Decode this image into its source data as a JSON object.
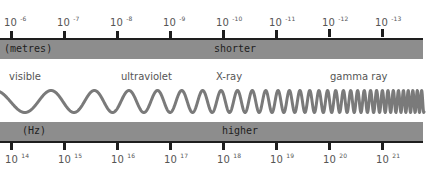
{
  "diagram": {
    "wavelength_scale": {
      "unit_label": "(metres)",
      "direction_label": "shorter",
      "ticks": [
        {
          "base": "10",
          "exp": "-6"
        },
        {
          "base": "10",
          "exp": "-7"
        },
        {
          "base": "10",
          "exp": "-8"
        },
        {
          "base": "10",
          "exp": "-9"
        },
        {
          "base": "10",
          "exp": "-10"
        },
        {
          "base": "10",
          "exp": "-11"
        },
        {
          "base": "10",
          "exp": "-12"
        },
        {
          "base": "10",
          "exp": "-13"
        }
      ]
    },
    "bands": [
      {
        "label": "visible"
      },
      {
        "label": "ultraviolet"
      },
      {
        "label": "X-ray"
      },
      {
        "label": "gamma ray"
      }
    ],
    "frequency_scale": {
      "unit_label": "(Hz)",
      "direction_label": "higher",
      "ticks": [
        {
          "base": "10",
          "exp": "14"
        },
        {
          "base": "10",
          "exp": "15"
        },
        {
          "base": "10",
          "exp": "16"
        },
        {
          "base": "10",
          "exp": "17"
        },
        {
          "base": "10",
          "exp": "18"
        },
        {
          "base": "10",
          "exp": "19"
        },
        {
          "base": "10",
          "exp": "20"
        },
        {
          "base": "10",
          "exp": "21"
        }
      ]
    },
    "colors": {
      "bar": "#8d8d8d",
      "axis_line": "#1e1e1e",
      "wave": "#7a7a7a",
      "text": "#555555"
    }
  }
}
